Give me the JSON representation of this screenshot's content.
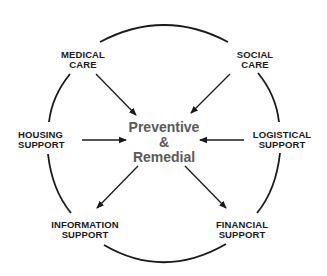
{
  "diagram": {
    "center": {
      "lines": [
        "Preventive",
        "&",
        "Remedial"
      ],
      "color": "#5a5a5a"
    },
    "nodes": [
      {
        "id": "medical-care",
        "lines": [
          "MEDICAL",
          "CARE"
        ]
      },
      {
        "id": "social-care",
        "lines": [
          "SOCIAL",
          "CARE"
        ]
      },
      {
        "id": "housing-support",
        "lines": [
          "HOUSING",
          "SUPPORT"
        ]
      },
      {
        "id": "logistical-support",
        "lines": [
          "LOGISTICAL",
          "SUPPORT"
        ]
      },
      {
        "id": "information-support",
        "lines": [
          "INFORMATION",
          "SUPPORT"
        ]
      },
      {
        "id": "financial-support",
        "lines": [
          "FINANCIAL",
          "SUPPORT"
        ]
      }
    ],
    "arrows": [
      {
        "from": "medical-care",
        "to": "center",
        "direction": "inward"
      },
      {
        "from": "social-care",
        "to": "center",
        "direction": "inward"
      },
      {
        "from": "housing-support",
        "to": "center",
        "direction": "inward"
      },
      {
        "from": "logistical-support",
        "to": "center",
        "direction": "inward"
      },
      {
        "from": "center",
        "to": "information-support",
        "direction": "outward"
      },
      {
        "from": "center",
        "to": "financial-support",
        "direction": "outward"
      }
    ],
    "line_color": "#1a1a1a"
  }
}
